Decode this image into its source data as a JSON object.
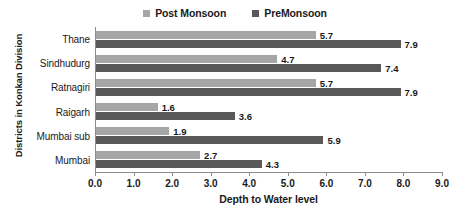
{
  "chart_data": {
    "type": "bar",
    "orientation": "horizontal",
    "title": "",
    "xlabel": "Depth to Water level",
    "ylabel": "Districts in Konkan Division",
    "categories": [
      "Mumbai",
      "Mumbai sub",
      "Raigarh",
      "Ratnagiri",
      "Sindhudurg",
      "Thane"
    ],
    "categories_top_to_bottom": [
      "Thane",
      "Sindhudurg",
      "Ratnagiri",
      "Raigarh",
      "Mumbai sub",
      "Mumbai"
    ],
    "series": [
      {
        "name": "Post Monsoon",
        "color": "#a6a6a6",
        "values": [
          2.7,
          1.9,
          1.6,
          5.7,
          4.7,
          5.7
        ]
      },
      {
        "name": "PreMonsoon",
        "color": "#595959",
        "values": [
          4.3,
          5.9,
          3.6,
          7.9,
          7.4,
          7.9
        ]
      }
    ],
    "xlim": [
      0.0,
      9.0
    ],
    "xticks": [
      "0.0",
      "1.0",
      "2.0",
      "3.0",
      "4.0",
      "5.0",
      "6.0",
      "7.0",
      "8.0",
      "9.0"
    ],
    "xtick_values": [
      0,
      1,
      2,
      3,
      4,
      5,
      6,
      7,
      8,
      9
    ],
    "grid": false,
    "legend_position": "top-center",
    "data_labels": true
  },
  "legend": {
    "entries": [
      {
        "label": "Post Monsoon",
        "color": "#a6a6a6"
      },
      {
        "label": "PreMonsoon",
        "color": "#595959"
      }
    ]
  },
  "axes": {
    "x_title": "Depth to Water level",
    "y_title": "Districts in Konkan Division"
  },
  "rows": [
    {
      "category": "Thane",
      "post_monsoon": "5.7",
      "pre_monsoon": "7.9"
    },
    {
      "category": "Sindhudurg",
      "post_monsoon": "4.7",
      "pre_monsoon": "7.4"
    },
    {
      "category": "Ratnagiri",
      "post_monsoon": "5.7",
      "pre_monsoon": "7.9"
    },
    {
      "category": "Raigarh",
      "post_monsoon": "1.6",
      "pre_monsoon": "3.6"
    },
    {
      "category": "Mumbai sub",
      "post_monsoon": "1.9",
      "pre_monsoon": "5.9"
    },
    {
      "category": "Mumbai",
      "post_monsoon": "2.7",
      "pre_monsoon": "4.3"
    }
  ],
  "xticks": [
    {
      "label": "0.0"
    },
    {
      "label": "1.0"
    },
    {
      "label": "2.0"
    },
    {
      "label": "3.0"
    },
    {
      "label": "4.0"
    },
    {
      "label": "5.0"
    },
    {
      "label": "6.0"
    },
    {
      "label": "7.0"
    },
    {
      "label": "8.0"
    },
    {
      "label": "9.0"
    }
  ],
  "colors": {
    "post_monsoon": "#a6a6a6",
    "pre_monsoon": "#595959",
    "axis": "#8c8c8c",
    "text": "#1a1a1a",
    "background": "#ffffff"
  }
}
